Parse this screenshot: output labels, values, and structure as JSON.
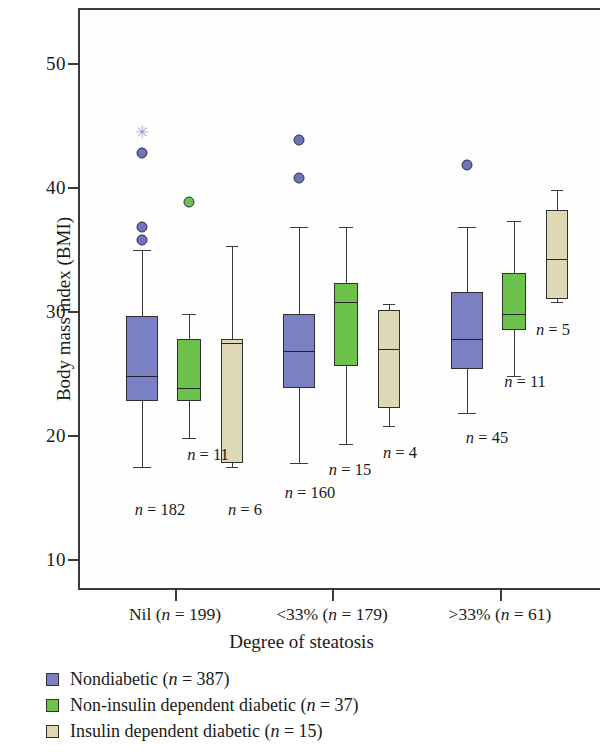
{
  "chart_data": {
    "type": "box",
    "title": "",
    "xlabel": "Degree of steatosis",
    "ylabel": "Body mass index (BMI)",
    "ylim": [
      7,
      54
    ],
    "yticks": [
      10,
      20,
      30,
      40,
      50
    ],
    "grid": false,
    "legend_position": "below-axes",
    "categories": [
      "Nil (n = 199)",
      "<33% (n = 179)",
      ">33% (n = 61)"
    ],
    "series": [
      {
        "name": "Nondiabetic (n = 387)",
        "color": "#7b7fc4",
        "boxes": [
          {
            "category": "Nil (n = 199)",
            "n_label": "n = 182",
            "whisker_low": 17.7,
            "q1": 23.0,
            "median": 25.0,
            "q3": 29.8,
            "whisker_high": 35.2,
            "outliers": [
              36.0,
              37.0,
              43.0
            ],
            "extreme_outliers": [
              44.7
            ]
          },
          {
            "category": "<33% (n = 179)",
            "n_label": "n = 160",
            "whisker_low": 18.0,
            "q1": 24.0,
            "median": 27.0,
            "q3": 30.0,
            "whisker_high": 37.0,
            "outliers": [
              41.0,
              44.0
            ],
            "extreme_outliers": []
          },
          {
            "category": ">33% (n = 61)",
            "n_label": "n = 45",
            "whisker_low": 22.0,
            "q1": 25.6,
            "median": 28.0,
            "q3": 31.8,
            "whisker_high": 37.0,
            "outliers": [
              42.0
            ],
            "extreme_outliers": []
          }
        ]
      },
      {
        "name": "Non-insulin dependent diabetic (n = 37)",
        "color": "#6cc24a",
        "boxes": [
          {
            "category": "Nil (n = 199)",
            "n_label": "n = 11",
            "whisker_low": 20.0,
            "q1": 23.0,
            "median": 24.0,
            "q3": 28.0,
            "whisker_high": 30.0,
            "outliers": [
              39.0
            ],
            "extreme_outliers": []
          },
          {
            "category": "<33% (n = 179)",
            "n_label": "n = 15",
            "whisker_low": 19.5,
            "q1": 25.8,
            "median": 31.0,
            "q3": 32.5,
            "whisker_high": 37.0,
            "outliers": [],
            "extreme_outliers": []
          },
          {
            "category": ">33% (n = 61)",
            "n_label": "n = 11",
            "whisker_low": 25.0,
            "q1": 28.7,
            "median": 30.0,
            "q3": 33.3,
            "whisker_high": 37.5,
            "outliers": [],
            "extreme_outliers": []
          }
        ]
      },
      {
        "name": "Insulin dependent diabetic (n = 15)",
        "color": "#ded9b4",
        "boxes": [
          {
            "category": "Nil (n = 199)",
            "n_label": "n = 6",
            "whisker_low": 17.7,
            "q1": 18.0,
            "median": 27.7,
            "q3": 28.0,
            "whisker_high": 35.5,
            "outliers": [],
            "extreme_outliers": []
          },
          {
            "category": "<33% (n = 179)",
            "n_label": "n = 4",
            "whisker_low": 21.0,
            "q1": 22.4,
            "median": 27.2,
            "q3": 30.3,
            "whisker_high": 30.8,
            "outliers": [],
            "extreme_outliers": []
          },
          {
            "category": ">33% (n = 61)",
            "n_label": "n = 5",
            "whisker_low": 31.0,
            "q1": 31.2,
            "median": 34.4,
            "q3": 38.4,
            "whisker_high": 40.0,
            "outliers": [],
            "extreme_outliers": []
          }
        ]
      }
    ]
  },
  "axis": {
    "ylabel": "Body mass index (BMI)",
    "xlabel": "Degree of steatosis",
    "ytick_labels": [
      "50",
      "40",
      "30",
      "20",
      "10"
    ],
    "xtick_labels": [
      {
        "prefix": "Nil (",
        "n_italic": "n",
        "eq": " = 199)"
      },
      {
        "prefix": "<33% (",
        "n_italic": "n",
        "eq": " = 179)"
      },
      {
        "prefix": ">33% (",
        "n_italic": "n",
        "eq": " = 61)"
      }
    ]
  },
  "legend": {
    "items": [
      {
        "swatch": "blue",
        "label_prefix": "Nondiabetic (",
        "label_n": "n",
        "label_suffix": " = 387)"
      },
      {
        "swatch": "green",
        "label_prefix": "Non-insulin dependent diabetic (",
        "label_n": "n",
        "label_suffix": " = 37)"
      },
      {
        "swatch": "beige",
        "label_prefix": "Insulin dependent diabetic (",
        "label_n": "n",
        "label_suffix": " = 15)"
      }
    ]
  },
  "n_labels": {
    "g1_blue": "182",
    "g1_green": "11",
    "g1_beige": "6",
    "g2_blue": "160",
    "g2_green": "15",
    "g2_beige": "4",
    "g3_blue": "45",
    "g3_green": "11",
    "g3_beige": "5"
  }
}
